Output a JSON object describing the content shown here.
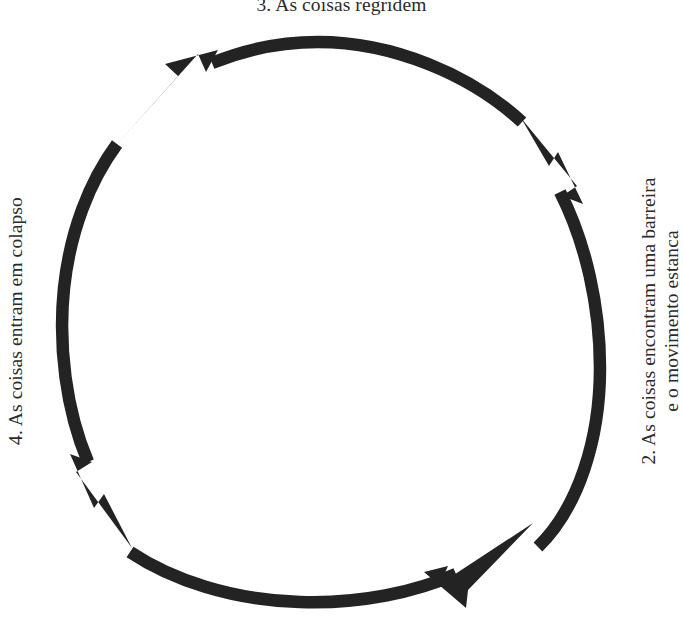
{
  "diagram": {
    "type": "cycle",
    "title_clipped_at_top": true,
    "background_color": "#ffffff",
    "ink_color": "#232323",
    "text_color": "#2b2b2b",
    "stroke_width_px": 12,
    "circle": {
      "center_x": 331,
      "center_y": 322,
      "radius": 268
    },
    "arrow_direction": "counter-clockwise",
    "arc_count": 4,
    "labels": {
      "top": "3. As coisas regridem",
      "right_line1": "2. As coisas encontram uma barreira",
      "right_line2": "e o movimento estanca",
      "left": "4. As coisas entram em colapso"
    },
    "arcs": [
      {
        "name": "arc-top-right",
        "start_deg": -72,
        "end_deg": -162,
        "arrowhead_at": "end"
      },
      {
        "name": "arc-top-left",
        "start_deg": 162,
        "end_deg": 108,
        "arrowhead_at": "end"
      },
      {
        "name": "arc-bottom-left",
        "start_deg": 108,
        "end_deg": 18,
        "arrowhead_at": "end"
      },
      {
        "name": "arc-bottom-right",
        "start_deg": 18,
        "end_deg": -72,
        "arrowhead_at": "end"
      }
    ]
  }
}
